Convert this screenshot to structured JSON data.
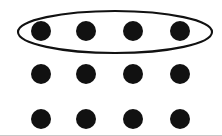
{
  "figure": {
    "background_color": "#ffffff",
    "width": 222,
    "height": 136,
    "dot_color": "#111111",
    "stroke_color": "#111111",
    "baseline_color": "#c9c9c9"
  },
  "chart_data": {
    "type": "scatter",
    "xlabel": "",
    "ylabel": "",
    "grid": false,
    "legend": null,
    "rows": 3,
    "columns": 4,
    "total_dots": 12,
    "column_x": [
      41,
      86,
      133,
      180
    ],
    "row_y": [
      31,
      74,
      119
    ],
    "dot_radius": 10,
    "x": [
      41,
      86,
      133,
      180,
      41,
      86,
      133,
      180,
      41,
      86,
      133,
      180
    ],
    "y": [
      31,
      31,
      31,
      31,
      74,
      74,
      74,
      74,
      119,
      119,
      119,
      119
    ],
    "xlim": [
      0,
      222
    ],
    "ylim": [
      136,
      0
    ],
    "annotations": [
      {
        "kind": "ellipse",
        "label": "grouping-ellipse-top-row",
        "cx": 115,
        "cy": 32,
        "rx": 97,
        "ry": 21,
        "stroke_width": 2,
        "fill": "none",
        "encloses": [
          1,
          2,
          3,
          4
        ]
      }
    ]
  },
  "dots": [
    {
      "id": "dot-r1-c1",
      "row": 1,
      "col": 1,
      "cx": 41,
      "cy": 31,
      "r": 10,
      "circled": true
    },
    {
      "id": "dot-r1-c2",
      "row": 1,
      "col": 2,
      "cx": 86,
      "cy": 31,
      "r": 10,
      "circled": true
    },
    {
      "id": "dot-r1-c3",
      "row": 1,
      "col": 3,
      "cx": 133,
      "cy": 31,
      "r": 10,
      "circled": true
    },
    {
      "id": "dot-r1-c4",
      "row": 1,
      "col": 4,
      "cx": 180,
      "cy": 31,
      "r": 10,
      "circled": true
    },
    {
      "id": "dot-r2-c1",
      "row": 2,
      "col": 1,
      "cx": 41,
      "cy": 74,
      "r": 10,
      "circled": false
    },
    {
      "id": "dot-r2-c2",
      "row": 2,
      "col": 2,
      "cx": 86,
      "cy": 74,
      "r": 10,
      "circled": false
    },
    {
      "id": "dot-r2-c3",
      "row": 2,
      "col": 3,
      "cx": 133,
      "cy": 74,
      "r": 10,
      "circled": false
    },
    {
      "id": "dot-r2-c4",
      "row": 2,
      "col": 4,
      "cx": 180,
      "cy": 74,
      "r": 10,
      "circled": false
    },
    {
      "id": "dot-r3-c1",
      "row": 3,
      "col": 1,
      "cx": 41,
      "cy": 119,
      "r": 10,
      "circled": false
    },
    {
      "id": "dot-r3-c2",
      "row": 3,
      "col": 2,
      "cx": 86,
      "cy": 119,
      "r": 10,
      "circled": false
    },
    {
      "id": "dot-r3-c3",
      "row": 3,
      "col": 3,
      "cx": 133,
      "cy": 119,
      "r": 10,
      "circled": false
    },
    {
      "id": "dot-r3-c4",
      "row": 3,
      "col": 4,
      "cx": 180,
      "cy": 119,
      "r": 10,
      "circled": false
    }
  ],
  "baseline": {
    "x1": 0,
    "y1": 135,
    "x2": 222,
    "y2": 135
  },
  "accessible_text": "Twelve black dots arranged in three rows of four. An ellipse is drawn around the four dots in the top row."
}
